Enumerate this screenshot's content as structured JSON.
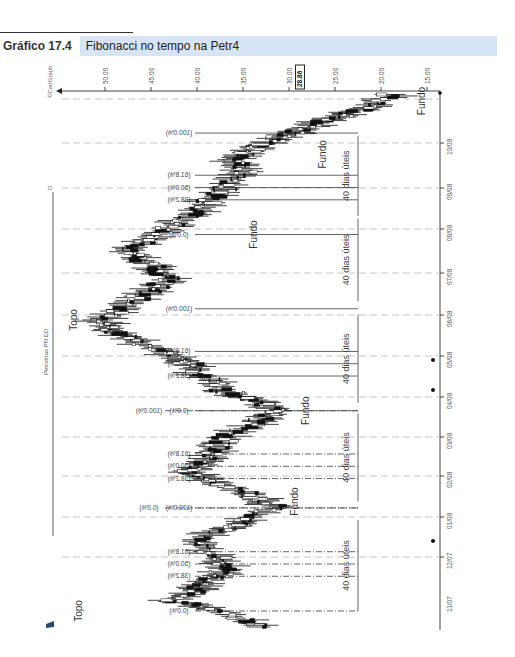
{
  "figure": {
    "number": "Gráfico 17.4",
    "title": "Fibonacci no tempo na Petr4"
  },
  "chart_data": {
    "type": "candlestick",
    "orientation": "rotated-90-clockwise",
    "title": "Fibonacci no tempo na Petr4",
    "instrument_label": "Petrobras PN ED",
    "copyright": "©CartGraph",
    "corner_mark": "D",
    "price_axis": {
      "ticks": [
        50.0,
        45.0,
        40.0,
        35.0,
        30.0,
        25.0,
        20.0,
        15.0
      ],
      "tick_labels": [
        "50.00",
        "45.00",
        "40.00",
        "35.00",
        "30.00",
        "25.00",
        "20.00",
        "15.00"
      ],
      "current_price": 28.86,
      "current_price_label": "28.86"
    },
    "time_axis": {
      "ticks": [
        "11/07",
        "12/07",
        "01/08",
        "02/08",
        "03/08",
        "04/08",
        "05/08",
        "06/08",
        "07/08",
        "08/08",
        "09/08",
        "10/08"
      ]
    },
    "markers_on_axis": [
      {
        "date_pos": 0.42,
        "label": "dot"
      },
      {
        "date_pos": 0.58,
        "label": "dot"
      },
      {
        "date_pos": 0.66,
        "label": "dot"
      }
    ],
    "price_path": [
      {
        "t": 0.0,
        "p": 33.0
      },
      {
        "t": 0.03,
        "p": 37.5
      },
      {
        "t": 0.05,
        "p": 43.0
      },
      {
        "t": 0.07,
        "p": 40.0
      },
      {
        "t": 0.09,
        "p": 38.5
      },
      {
        "t": 0.11,
        "p": 36.5
      },
      {
        "t": 0.13,
        "p": 38.0
      },
      {
        "t": 0.155,
        "p": 40.0
      },
      {
        "t": 0.18,
        "p": 38.0
      },
      {
        "t": 0.2,
        "p": 34.5
      },
      {
        "t": 0.225,
        "p": 31.5
      },
      {
        "t": 0.245,
        "p": 34.0
      },
      {
        "t": 0.27,
        "p": 38.0
      },
      {
        "t": 0.29,
        "p": 41.0
      },
      {
        "t": 0.31,
        "p": 39.0
      },
      {
        "t": 0.335,
        "p": 38.0
      },
      {
        "t": 0.36,
        "p": 36.5
      },
      {
        "t": 0.385,
        "p": 33.0
      },
      {
        "t": 0.405,
        "p": 31.5
      },
      {
        "t": 0.425,
        "p": 34.0
      },
      {
        "t": 0.445,
        "p": 37.5
      },
      {
        "t": 0.47,
        "p": 39.5
      },
      {
        "t": 0.49,
        "p": 40.5
      },
      {
        "t": 0.51,
        "p": 43.0
      },
      {
        "t": 0.535,
        "p": 46.5
      },
      {
        "t": 0.555,
        "p": 49.5
      },
      {
        "t": 0.575,
        "p": 50.5
      },
      {
        "t": 0.6,
        "p": 48.0
      },
      {
        "t": 0.625,
        "p": 45.5
      },
      {
        "t": 0.65,
        "p": 43.0
      },
      {
        "t": 0.675,
        "p": 45.0
      },
      {
        "t": 0.7,
        "p": 47.5
      },
      {
        "t": 0.725,
        "p": 46.0
      },
      {
        "t": 0.75,
        "p": 43.0
      },
      {
        "t": 0.775,
        "p": 40.0
      },
      {
        "t": 0.8,
        "p": 38.5
      },
      {
        "t": 0.825,
        "p": 37.0
      },
      {
        "t": 0.85,
        "p": 35.0
      },
      {
        "t": 0.875,
        "p": 36.0
      },
      {
        "t": 0.895,
        "p": 34.0
      },
      {
        "t": 0.915,
        "p": 31.0
      },
      {
        "t": 0.935,
        "p": 28.0
      },
      {
        "t": 0.955,
        "p": 25.0
      },
      {
        "t": 0.975,
        "p": 21.0
      },
      {
        "t": 1.0,
        "p": 18.5
      }
    ],
    "annotations": [
      {
        "text": "Topo",
        "type": "label",
        "t": 0.03,
        "p": 52.5
      },
      {
        "text": "Fundo",
        "type": "label",
        "t": 0.235,
        "p": 29.0
      },
      {
        "text": "Fundo",
        "type": "label",
        "t": 0.405,
        "p": 27.8
      },
      {
        "text": "Topo",
        "type": "label",
        "t": 0.575,
        "p": 53.0
      },
      {
        "text": "Fundo",
        "type": "label",
        "t": 0.735,
        "p": 33.5
      },
      {
        "text": "Fundo",
        "type": "label",
        "t": 0.885,
        "p": 26.0
      },
      {
        "text": "Fundo",
        "type": "label",
        "t": 0.985,
        "p": 15.2
      }
    ],
    "fibonacci_time_sets": [
      {
        "style": "dash-dot",
        "levels": [
          {
            "label": "(0.0%)",
            "t": 0.03
          },
          {
            "label": "(38.2%)",
            "t": 0.095
          },
          {
            "label": "(50.0%)",
            "t": 0.118
          },
          {
            "label": "(61.8%)",
            "t": 0.141
          },
          {
            "label": "(100.0%)",
            "t": 0.223
          }
        ],
        "range_label": "40 dias úteis",
        "range": [
          0.03,
          0.2
        ]
      },
      {
        "style": "dash-dot",
        "levels": [
          {
            "label": "(0.0%)",
            "t": 0.223,
            "offset_label": true
          },
          {
            "label": "(38.2%)",
            "t": 0.278
          },
          {
            "label": "(50.0%)",
            "t": 0.301
          },
          {
            "label": "(61.8%)",
            "t": 0.324
          },
          {
            "label": "(100.0%)",
            "t": 0.405,
            "offset_label": true
          }
        ],
        "range_label": "40 dias úteis",
        "range": [
          0.235,
          0.4
        ]
      },
      {
        "style": "solid",
        "levels": [
          {
            "label": "(0.0%)",
            "t": 0.405
          },
          {
            "label": "(38.2%)",
            "t": 0.47
          },
          {
            "label": "(50.0%)",
            "t": 0.493
          },
          {
            "label": "(61.8%)",
            "t": 0.516
          },
          {
            "label": "(100.0%)",
            "t": 0.596
          }
        ],
        "range_label": "40 dias úteis",
        "range": [
          0.42,
          0.585
        ]
      },
      {
        "style": "solid",
        "levels": [
          {
            "label": "(0.0%)",
            "t": 0.735
          },
          {
            "label": "(38.2%)",
            "t": 0.8
          },
          {
            "label": "(50.0%)",
            "t": 0.823
          },
          {
            "label": "(61.8%)",
            "t": 0.846
          },
          {
            "label": "(100.0%)",
            "t": 0.925
          }
        ],
        "range_label": "40 dias úteis",
        "range": [
          0.77,
          0.92
        ]
      }
    ],
    "extra_range_labels": [
      {
        "label": "40 dias úteis",
        "range": [
          0.61,
          0.765
        ]
      }
    ],
    "grid": {
      "dashed_month_lines": true
    },
    "legend": null
  }
}
